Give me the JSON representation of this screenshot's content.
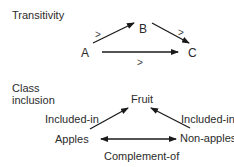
{
  "sections": {
    "transitivity": {
      "title": "Transitivity",
      "nodes": {
        "a": "A",
        "b": "B",
        "c": "C"
      },
      "edges": [
        {
          "from": "A",
          "to": "B",
          "label": ">"
        },
        {
          "from": "B",
          "to": "C",
          "label": ">"
        },
        {
          "from": "A",
          "to": "C",
          "label": ">"
        }
      ]
    },
    "class_inclusion": {
      "title_line1": "Class",
      "title_line2": "inclusion",
      "nodes": {
        "fruit": "Fruit",
        "apples": "Apples",
        "non_apples": "Non-apples"
      },
      "edges": [
        {
          "from": "Apples",
          "to": "Fruit",
          "label": "Included-in"
        },
        {
          "from": "Non-apples",
          "to": "Fruit",
          "label": "Included-in"
        },
        {
          "from": "Apples",
          "to": "Non-apples",
          "label": "Complement-of",
          "bidirectional": true
        }
      ]
    }
  },
  "colors": {
    "line": "#1a1a1a",
    "text": "#2b2b2b"
  }
}
